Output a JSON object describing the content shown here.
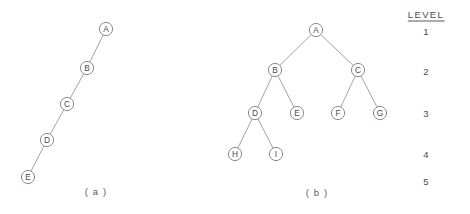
{
  "figure": {
    "background_color": "#ffffff",
    "line_color": "#9a9a9a",
    "node_stroke_color": "#7d7d7d",
    "text_color": "#4a4a4a",
    "node_radius": 6.6
  },
  "diagram_a": {
    "caption": "( a )",
    "caption_x": 96,
    "caption_y": 191,
    "nodes": [
      {
        "id": "A",
        "label": "A",
        "x": 106,
        "y": 29,
        "level": 1
      },
      {
        "id": "B",
        "label": "B",
        "x": 87,
        "y": 68,
        "level": 2
      },
      {
        "id": "C",
        "label": "C",
        "x": 67,
        "y": 104,
        "level": 3
      },
      {
        "id": "D",
        "label": "D",
        "x": 47,
        "y": 140,
        "level": 4
      },
      {
        "id": "E",
        "label": "E",
        "x": 28,
        "y": 177,
        "level": 5
      }
    ],
    "edges": [
      {
        "from": "A",
        "to": "B"
      },
      {
        "from": "B",
        "to": "C"
      },
      {
        "from": "C",
        "to": "D"
      },
      {
        "from": "D",
        "to": "E"
      }
    ]
  },
  "diagram_b": {
    "caption": "( b )",
    "caption_x": 317,
    "caption_y": 192,
    "nodes": [
      {
        "id": "A",
        "label": "A",
        "x": 316,
        "y": 30,
        "level": 1
      },
      {
        "id": "B",
        "label": "B",
        "x": 275,
        "y": 70,
        "level": 2
      },
      {
        "id": "C",
        "label": "C",
        "x": 358,
        "y": 70,
        "level": 2
      },
      {
        "id": "D",
        "label": "D",
        "x": 255,
        "y": 113,
        "level": 3
      },
      {
        "id": "E",
        "label": "E",
        "x": 297,
        "y": 113,
        "level": 3
      },
      {
        "id": "F",
        "label": "F",
        "x": 338,
        "y": 113,
        "level": 3
      },
      {
        "id": "G",
        "label": "G",
        "x": 380,
        "y": 113,
        "level": 3
      },
      {
        "id": "H",
        "label": "H",
        "x": 235,
        "y": 154,
        "level": 4
      },
      {
        "id": "I",
        "label": "I",
        "x": 276,
        "y": 154,
        "level": 4
      }
    ],
    "edges": [
      {
        "from": "A",
        "to": "B"
      },
      {
        "from": "A",
        "to": "C"
      },
      {
        "from": "B",
        "to": "D"
      },
      {
        "from": "B",
        "to": "E"
      },
      {
        "from": "C",
        "to": "F"
      },
      {
        "from": "C",
        "to": "G"
      },
      {
        "from": "D",
        "to": "H"
      },
      {
        "from": "D",
        "to": "I"
      }
    ]
  },
  "level_column": {
    "header": "LEVEL",
    "header_x": 426,
    "header_y": 15,
    "levels": [
      {
        "label": "1",
        "x": 426,
        "y": 31
      },
      {
        "label": "2",
        "x": 426,
        "y": 71
      },
      {
        "label": "3",
        "x": 426,
        "y": 113
      },
      {
        "label": "4",
        "x": 426,
        "y": 154
      },
      {
        "label": "5",
        "x": 426,
        "y": 181
      }
    ]
  }
}
